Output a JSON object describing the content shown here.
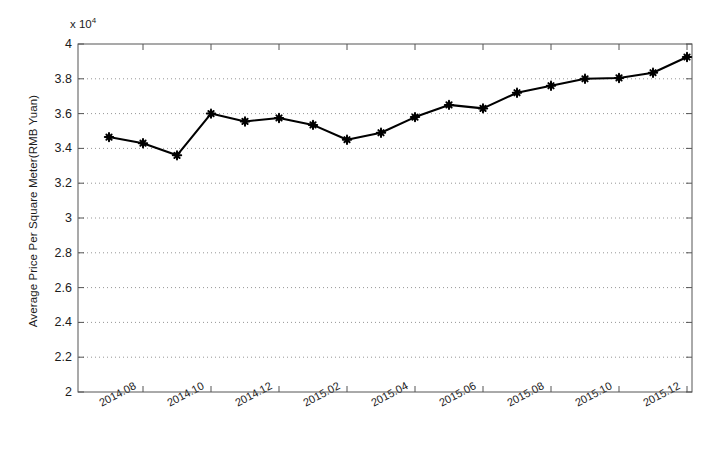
{
  "chart_data": {
    "type": "line",
    "title": "",
    "xlabel": "",
    "ylabel": "Average Price Per Square Meter(RMB Yuan)",
    "y_exponent_label": "x 10",
    "y_exponent_power": "4",
    "y_scale_factor": 10000,
    "ylim": [
      2,
      4
    ],
    "ytick_labels": [
      "4",
      "3.8",
      "3.6",
      "3.4",
      "3.2",
      "3",
      "2.8",
      "2.6",
      "2.4",
      "2.2",
      "2"
    ],
    "ytick_values": [
      4,
      3.8,
      3.6,
      3.4,
      3.2,
      3,
      2.8,
      2.6,
      2.4,
      2.2,
      2
    ],
    "xtick_labels": [
      "2014.08",
      "2014.10",
      "2014.12",
      "2015.02",
      "2015.04",
      "2015.06",
      "2015.08",
      "2015.10",
      "2015.12"
    ],
    "xtick_values": [
      "2014.08",
      "2014.10",
      "2014.12",
      "2015.02",
      "2015.04",
      "2015.06",
      "2015.08",
      "2015.10",
      "2015.12"
    ],
    "grid": "horizontal-dotted",
    "legend": null,
    "line_color": "#000000",
    "marker": "plus-star",
    "x": [
      "2014.07",
      "2014.08",
      "2014.09",
      "2014.10",
      "2014.11",
      "2014.12",
      "2015.01",
      "2015.02",
      "2015.03",
      "2015.04",
      "2015.05",
      "2015.06",
      "2015.07",
      "2015.08",
      "2015.09",
      "2015.10",
      "2015.11",
      "2015.12"
    ],
    "values": [
      3.465,
      3.43,
      3.36,
      3.6,
      3.555,
      3.575,
      3.535,
      3.45,
      3.49,
      3.58,
      3.65,
      3.63,
      3.72,
      3.76,
      3.8,
      3.805,
      3.835,
      3.925
    ],
    "values_absolute": [
      34650,
      34300,
      33600,
      36000,
      35550,
      35750,
      35350,
      34500,
      34900,
      35800,
      36500,
      36300,
      37200,
      37600,
      38000,
      38050,
      38350,
      39250
    ],
    "series": [
      {
        "name": "Average Price Per Square Meter",
        "values": [
          3.465,
          3.43,
          3.36,
          3.6,
          3.555,
          3.575,
          3.535,
          3.45,
          3.49,
          3.58,
          3.65,
          3.63,
          3.72,
          3.76,
          3.8,
          3.805,
          3.835,
          3.925
        ]
      }
    ]
  }
}
